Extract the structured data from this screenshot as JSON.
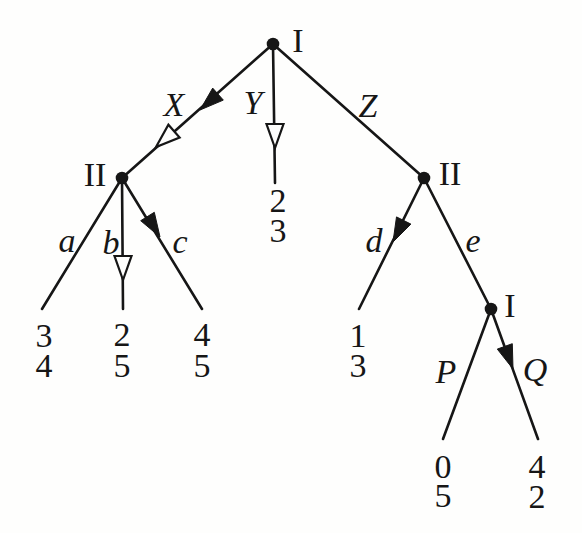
{
  "figure": {
    "background_color": "#fefefd",
    "ink_color": "#161616"
  },
  "tree": {
    "node_labels": {
      "root": "I",
      "left": "II",
      "right": "II",
      "lower": "I"
    },
    "edge_labels": {
      "X": "X",
      "Y": "Y",
      "Z": "Z",
      "a": "a",
      "b": "b",
      "c": "c",
      "d": "d",
      "e": "e",
      "P": "P",
      "Q": "Q"
    },
    "payoffs": {
      "Y": [
        "2",
        "3"
      ],
      "a": [
        "3",
        "4"
      ],
      "b": [
        "2",
        "5"
      ],
      "c": [
        "4",
        "5"
      ],
      "d": [
        "1",
        "3"
      ],
      "P": [
        "0",
        "5"
      ],
      "Q": [
        "4",
        "2"
      ]
    },
    "arrows": {
      "X": [
        "filled",
        "open"
      ],
      "Y": [
        "open"
      ],
      "b": [
        "open"
      ],
      "c": [
        "filled"
      ],
      "d": [
        "filled"
      ],
      "Q": [
        "filled"
      ]
    }
  }
}
